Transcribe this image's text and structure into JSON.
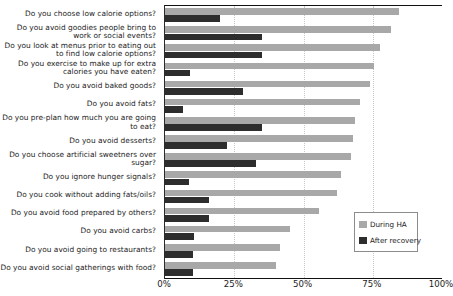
{
  "chart_data": {
    "type": "bar",
    "orientation": "horizontal",
    "title": "",
    "xlabel": "",
    "ylabel": "",
    "xlim": [
      0,
      100
    ],
    "xtick_labels": [
      "0%",
      "25%",
      "50%",
      "75%",
      "100%"
    ],
    "xtick_values": [
      0,
      25,
      50,
      75,
      100
    ],
    "grid": true,
    "grid_axis": "x",
    "legend_position": "center-right",
    "categories": [
      "Do you choose low calorie options?",
      "Do you avoid goodies people bring to work or social events?",
      "Do you look at menus prior to eating out to find low calorie options?",
      "Do you exercise to make up for extra calories you have eaten?",
      "Do you avoid baked goods?",
      "Do you avoid fats?",
      "Do you pre-plan how much you are going to eat?",
      "Do you avoid desserts?",
      "Do you choose artificial sweetners over sugar?",
      "Do you ignore hunger signals?",
      "Do you cook without adding fats/oils?",
      "Do you avoid food prepared by others?",
      "Do you avoid carbs?",
      "Do you avoid going to restaurants?",
      "Do you avoid social gatherings with food?"
    ],
    "series": [
      {
        "name": "During HA",
        "color": "#a8a8a8",
        "values": [
          84.5,
          81.5,
          77.5,
          75.5,
          74,
          70.5,
          68.5,
          68,
          67,
          63.5,
          62,
          55.5,
          45,
          41.5,
          40
        ]
      },
      {
        "name": "After recovery",
        "color": "#2d2d2d",
        "values": [
          20,
          35,
          35,
          9,
          28,
          6.5,
          35,
          22.5,
          33,
          8.5,
          16,
          16,
          10.5,
          10,
          10
        ]
      }
    ]
  },
  "legend": {
    "entries": [
      {
        "label": "During HA"
      },
      {
        "label": "After recovery"
      }
    ]
  }
}
